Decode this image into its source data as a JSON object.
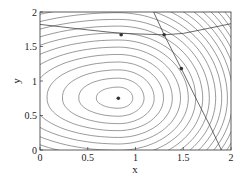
{
  "chart_data": {
    "type": "contour",
    "title": "",
    "xlabel": "x",
    "ylabel": "y",
    "xlim": [
      0,
      2
    ],
    "ylim": [
      0,
      2
    ],
    "xticks": [
      0,
      0.5,
      1,
      1.5,
      2
    ],
    "yticks": [
      0,
      0.5,
      1,
      1.5,
      2
    ],
    "xtick_labels": [
      "0",
      "0.5",
      "1",
      "1.5",
      "2"
    ],
    "ytick_labels": [
      "0",
      "0.5",
      "1",
      "1.5",
      "2"
    ],
    "grid": false,
    "legend": null,
    "contour_center": [
      0.82,
      0.75
    ],
    "contour_levels_count": 20,
    "points": [
      {
        "x": 0.82,
        "y": 0.75,
        "label": "unconstrained minimum"
      },
      {
        "x": 0.85,
        "y": 1.67,
        "label": "constrained point A"
      },
      {
        "x": 1.3,
        "y": 1.67,
        "label": "constrained point B (intersection)"
      },
      {
        "x": 1.48,
        "y": 1.18,
        "label": "constrained point C"
      }
    ],
    "constraint_curves": [
      {
        "name": "shallow constraint",
        "points": [
          [
            0,
            1.82
          ],
          [
            0.5,
            1.74
          ],
          [
            0.85,
            1.69
          ],
          [
            1.3,
            1.67
          ],
          [
            1.5,
            1.69
          ],
          [
            1.75,
            1.76
          ],
          [
            2,
            1.83
          ]
        ]
      },
      {
        "name": "steep constraint",
        "points": [
          [
            1.19,
            2
          ],
          [
            1.3,
            1.67
          ],
          [
            1.48,
            1.18
          ],
          [
            1.65,
            0.7
          ],
          [
            1.78,
            0.35
          ],
          [
            1.9,
            0
          ]
        ]
      }
    ]
  },
  "colors": {
    "contour": "#555555",
    "axis": "#333333",
    "marker": "#333333",
    "constraint": "#444444"
  }
}
